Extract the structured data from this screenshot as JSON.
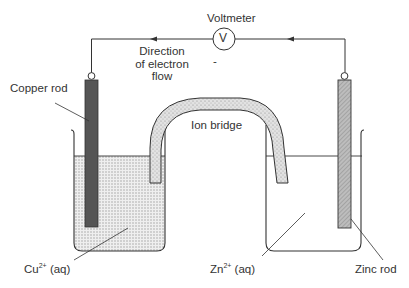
{
  "labels": {
    "voltmeter": "Voltmeter",
    "voltmeter_symbol": "V",
    "electron_flow_line1": "Direction",
    "electron_flow_line2": "of electron",
    "electron_flow_line3": "flow",
    "minus_sign": "-",
    "copper_rod": "Copper rod",
    "ion_bridge": "Ion bridge",
    "copper_ion_base": "Cu",
    "copper_ion_charge": "2+",
    "copper_ion_state": " (aq)",
    "zinc_ion_base": "Zn",
    "zinc_ion_charge": "2+",
    "zinc_ion_state": " (aq)",
    "zinc_rod": "Zinc rod"
  },
  "colors": {
    "line": "#333333",
    "copper_rod": "#555555",
    "zinc_rod": "#b5b5b5",
    "solution_left": "#e4e4e4",
    "bridge_fill": "#d6d6d6",
    "text": "#333333"
  }
}
